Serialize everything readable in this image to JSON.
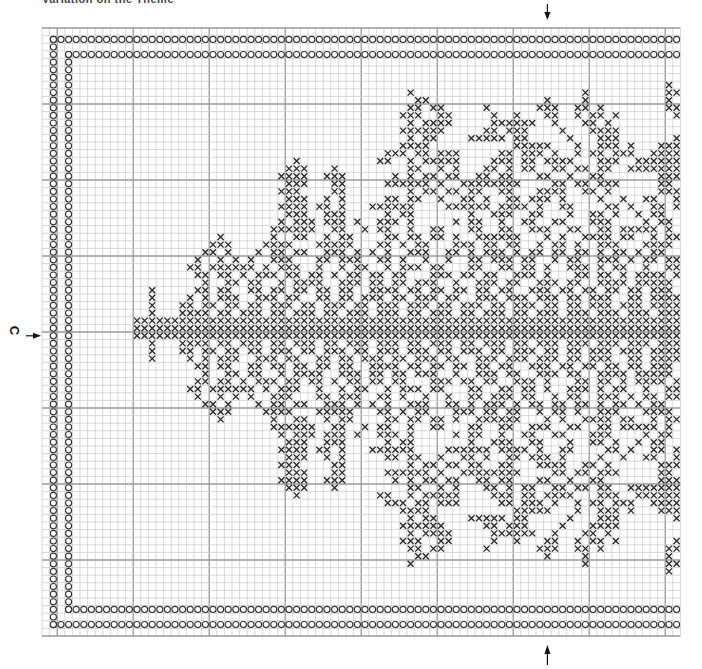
{
  "chart": {
    "title_fragment": "Variation on the Theme",
    "center_marker_label": "C",
    "grid": {
      "origin_x": 42,
      "origin_y": 28,
      "cell_size": 7.6,
      "cols": 84,
      "rows": 80,
      "major_every": 10,
      "major_col_offset": 2,
      "major_row_offset": 0
    },
    "colors": {
      "background": "#ffffff",
      "minor_grid": "#c8c8c8",
      "major_grid": "#9a9a9a",
      "stitch": "#2a2a2a",
      "stitch_fill": "#d9d9d9",
      "border_symbol": "#333333",
      "marker": "#111111"
    },
    "legend": {
      "cross_symbol": "X = cross stitch (dark)",
      "circle_symbol": "O = border stitch"
    },
    "markers": {
      "top_arrow_col": 66,
      "bottom_arrow_col": 66,
      "center_row": 40
    },
    "border": {
      "outer_row_top": 1,
      "outer_row_bottom": 78,
      "outer_col_left": 1,
      "inner_row_top": 3,
      "inner_row_bottom": 76,
      "inner_col_left": 3
    }
  },
  "chart_data": {
    "type": "table",
    "xlabel": "",
    "ylabel": "",
    "legend": [
      "X cross stitch",
      "O border stitch"
    ],
    "center_marker": "C",
    "rows": [
      "..................................................................................",
      "..................................................................................",
      "..................................................................................",
      "..................................................................................",
      "..................................................................................",
      "..................................................................................",
      "..................................................................................X.X.",
      "............................................................................X..XXX.",
      "..........................................X......................X..........XXX.XX.",
      "...........................................XX...............X....X..........X...XX.",
      "..........................................XX.XX.....X......XXX..XX.X........XX..X..",
      ".........................................XXX..XX.....X..X...XX..X.XX.X.......XX..XX.",
      "..........................................X.XXXX.....XXXXXX..X...XX.X.........XXXX..",
      ".........................................XXXXXX.....XX.XXX....X...XXXX........XXX...",
      "..........................................X.XX....XXXXX.XX.....X...XXX.......XX....",
      ".........................................XXXX...........XXXXX...X..XXX.X...XXXXX...",
      ".......................................XXX.XX.XXX.....XX.XXX.X..X.XX.XXX..XXXXXX...",
      "...........................X..........XX..X.XXXXX....XXX.XX.XXXX...XXX..XXXXXXX..",
      "..........................XXX...X.........XX..X.X...XX.X.XX..XX.XX.XX..XXXXXXXX..",
      ".........................XXXX..XXX......X.X.XX.XX..XX.XX...XX..X..XX.......XXXX...",
      "..........................XXX...XX.....XXXXXX.X..XXXXXXXX....XX.XX.XXX.....XX.....",
      ".........................XXX....XX........X.XX.XX.XX..XX...XXXX..XX.X......XXX....",
      "..........................XXX..X.X.....XX.XX..X..XX.X..XX.XXX.X....X..X..XX..X....",
      ".........................XXXX.XX.X...XXXXXX....XXXXXX.XXXX.X..XX....XX.X..XX.X...",
      "..........................XXX..XXX.....X.XX.......X..XXX..XX...X..XX.X..X.XX..XX..",
      ".........................X.XXX.XXX.X..XXX.X.....X.XX..X..XX..XX...XXX....X.XX.XX.",
      "........................XXXXXX..XX..X.XX..X..XX...XX..XX..XXX..XX..XX.XXXXX.X.XX.",
      ".................X......X..XX..X.XX....XX.XX.XX.X..XXXXXX...X.X..XXXX.XX..X.XXXXX.",
      "................XXX....XXXX...XXXXX...XX.X.XX...XXX.XX.XX..X.XX.X..XXX...XXXX.XX..",
      "...............XX.X...X.XX.XX..XXX.X.X.X..XXX..XX.X.XXX.X.XX.XX.XX.X.XX.X.XX..XXX.",
      "..............X..X.X.X..XXX...XX.XXX..XX.X..X..X..XX.XXX.XX..X.XX..XXX.X.XX.XXXXX.",
      ".............XX.XXXXXX.X.XXX..X..X.XX..X.XXX.XX...XX..XX.XX.X..XXX.X.XX..X..XXXX.X",
      "..............XX.XX.X.XXX.XX.XX.X.XX.XX.XX...XXX.XX.XX..XXX.X...XX.XX.X.XXXX.X.XX.",
      "...............X..XX.XX..X.XXXX..XXX.XX.XX.XXX..X..XXX.XX..XXX.XX..XXXX.XXXXX.X.X",
      "........X.....XX.XX..XX.XX.XX.XX.XX..XXXX.XX.XX.XX.XX.XX..XXX.XX.XX.XX.XX.XXX.XX.",
      "........X....X.X.XXX..XXX.XX..XX.XX.XXX.XX.XXX.XX..XXX.XXX.XXX.XX.XXX..XX.XXXXX.X",
      "........X...XX.XX.XX.XX.XXX.XX.XXX.XX.XXX.XXX.XX.XXX.XX.XXX.XX.XX.XXX.XXX.XXXXXX.",
      "........X...XXXX.XX.XXX.XX.XXX.XX.XXX.XXX.XX.XXX.XX.XXX.XX.XXX.XXX.XXX.XXX.XXXXXX",
      "......XXXXXXXXXXXXXXXXXXXXXXXXXXXXXXXXXXXXXXXXXXXXXXXXXXXXXXXXXXXXXXXXXXXXXXXXXXX",
      "......XXXXXXXXXXXXXXXXXXXXXXXXXXXXXXXXXXXXXXXXXXXXXXXXXXXXXXXXXXXXXXXXXXXXXXXXXXX",
      "......XXXXXXXXXXXXXXXXXXXXXXXXXXXXXXXXXXXXXXXXXXXXXXXXXXXXXXXXXXXXXXXXXXXXXXXXXXX",
      "........X...XXXX.XX.XXX.XX.XXX.XX.XXX.XXX.XX.XXX.XX.XXX.XX.XXX.XXX.XXX.XXX.XXXXXX",
      "........X...XX.XX.XX.XX.XXX.XX.XXX.XX.XXX.XXX.XX.XXX.XX.XXX.XX.XX.XXX.XXX.XXXXXX.",
      "........X....X.X.XXX..XXX.XX..XX.XX.XXX.XX.XXX.XX..XXX.XXX.XXX.XX.XXX..XX.XXXXX.X",
      "..............XX.XX..XX.XX.XX.XX.XX..XXXX.XX.XX.XX.XX.XX..XXX.XX.XX.XX.XX.XXX.XX.",
      "...............X..XX.XX..X.XXXX..XXX.XX.XX.XXX..X..XXX.XX..XXX.XX..XXXX.XXXXX.X.X",
      "..............XX.XX.X.XXX.XX.XX.X.XX.XX.XX...XXX.XX.XX..XXX.X...XX.XX.X.XXXX.X.XX.",
      ".............XX.XXXXXX.X.XXX..X..X.XX..X.XXX.XX...XX..XX.XX.X..XXX.X.XX..X..XXXX.X",
      "..............X..X.X.X..XXX...XX.XXX..XX.X..X..X..XX.XXX.XX..X.XX..XXX.X.XX.XXXXX.",
      "...............XX.X...X.XX.XX..XXX.X.X.X..XXX..XX.X.XXX.X.XX.XX.XX.X.XX.X.XX..XXX.",
      "................XXX....XXXX...XXXXX...XX.X.XX...XXX.XX.XX..X.XX.X..XXX...XXXX.XX..",
      ".................X......X..XX..X.XX....XX.XX.XX.X..XXXXXX...X.X..XXXX.XX..X.XXXXX.",
      "........................XXXXXX..XX..X.XX..X..XX...XX..XX..XXX..XX..XX.XXXXX.X.XX.",
      ".........................X.XXX.XXX.X..XXX.X.....X.XX..X..XX..XX...XXX....X.XX.XX.",
      "..........................XXX..XXX.....X.XX.......X..XXX..XX...X..XX.X..X.XX..XX..",
      ".........................XXXX.XX.X...XXXXXX....XXXXXX.XXXX.X..XX....XX.X..XX.X...",
      "..........................XXX..X.X.....XX.XX..X..XX.X..XX.XXX.X....X..X..XX..X....",
      ".........................XXX....XX........X.XX.XX.XX..XX...XXXX..XX.X......XXX....",
      "..........................XXX...XX.....XXXXXX.X..XXXXXXXX....XX.XX.XXX.....XX.....",
      ".........................XXXX..XXX......X.X.XX.XX..XX.XX...XX..X..XX.......XXXX...",
      "..........................XXX...X.........XX..X.X...XX.X.XX..XX.XX.XX..XXXXXXXX..",
      "...........................X..........XX..X.XXXXX....XXX.XX.XXXX...XXX..XXXXXXX..",
      ".......................................XXX.XX.XXX.....XX.XXX.X..X.XX.XXX..XXXXXX...",
      ".........................................XXXX...........XXXXX...X..XXX.X...XXXXX...",
      "..........................................X.XX....XXXXX.XX.....X...XXX.......XX....",
      ".........................................XXXXXX.....XX.XXX....X...XXXX........XXX...",
      "..........................................X.XXXX.....XXXXXX..X...XX.X.........XXXX..",
      ".........................................XXX..XX.....X..X...XX..X.XX.X.......XX..XX.",
      "..........................................XX.XX.....X......XXX..XX.X........XX..X..",
      "...........................................XX...............X....X..........X...XX.",
      "..........................................X......................X..........XXX.XX.",
      "............................................................................X..XXX.",
      "..................................................................................X.X.",
      "..................................................................................",
      "..................................................................................",
      "..................................................................................",
      "..................................................................................",
      "..................................................................................",
      ".................................................................................."
    ]
  }
}
